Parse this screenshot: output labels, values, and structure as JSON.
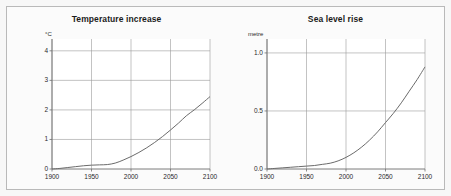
{
  "figure": {
    "background_color": "#f7f7f7",
    "panel_background_color": "#ffffff",
    "border_color": "#b9b9b9",
    "curve_color": "#6b6b6b",
    "grid_color": "#9a9a9a",
    "axis_color": "#6e6e6e"
  },
  "chart_data": [
    {
      "type": "line",
      "panel_letter": "a",
      "title": "Temperature increase",
      "xlabel": "",
      "ylabel": "",
      "yunit": "°C",
      "xlim": [
        1900,
        2100
      ],
      "ylim": [
        0,
        4.4
      ],
      "grid": true,
      "legend": "none",
      "xticks": [
        1900,
        1950,
        2000,
        2050,
        2100
      ],
      "xticklabels": [
        "1900",
        "1950",
        "2000",
        "2050",
        "2100"
      ],
      "yticks": [
        0,
        1,
        2,
        3,
        4
      ],
      "yticklabels": [
        "0",
        "1",
        "2",
        "3",
        "4"
      ],
      "series": [
        {
          "name": "Temperature increase",
          "x": [
            1900,
            1910,
            1920,
            1930,
            1940,
            1950,
            1960,
            1970,
            1980,
            1990,
            2000,
            2010,
            2020,
            2030,
            2040,
            2050,
            2060,
            2070,
            2080,
            2090,
            2100
          ],
          "values": [
            0.0,
            0.02,
            0.05,
            0.08,
            0.11,
            0.13,
            0.14,
            0.15,
            0.2,
            0.3,
            0.42,
            0.56,
            0.72,
            0.9,
            1.1,
            1.32,
            1.55,
            1.8,
            2.0,
            2.22,
            2.45
          ]
        }
      ]
    },
    {
      "type": "line",
      "panel_letter": "b",
      "title": "Sea level rise",
      "xlabel": "",
      "ylabel": "",
      "yunit": "metre",
      "xlim": [
        1900,
        2100
      ],
      "ylim": [
        0,
        1.12
      ],
      "grid": true,
      "legend": "none",
      "xticks": [
        1900,
        1950,
        2000,
        2050,
        2100
      ],
      "xticklabels": [
        "1900",
        "1950",
        "2000",
        "2050",
        "2100"
      ],
      "yticks": [
        0.0,
        0.5,
        1.0
      ],
      "yticklabels": [
        "0.0",
        "0.5",
        "1.0"
      ],
      "series": [
        {
          "name": "Sea level rise",
          "x": [
            1900,
            1910,
            1920,
            1930,
            1940,
            1950,
            1960,
            1970,
            1980,
            1990,
            2000,
            2010,
            2020,
            2030,
            2040,
            2050,
            2060,
            2070,
            2080,
            2090,
            2100
          ],
          "values": [
            0.0,
            0.005,
            0.01,
            0.015,
            0.02,
            0.025,
            0.03,
            0.04,
            0.05,
            0.07,
            0.1,
            0.14,
            0.19,
            0.25,
            0.32,
            0.4,
            0.48,
            0.57,
            0.67,
            0.77,
            0.88
          ]
        }
      ]
    }
  ]
}
